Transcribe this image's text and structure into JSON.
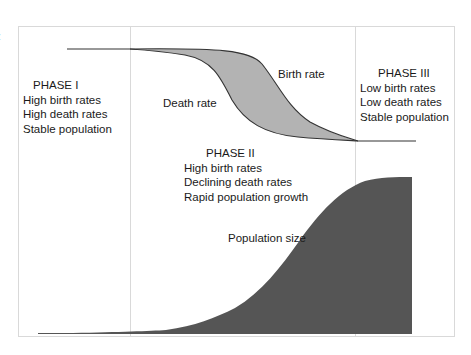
{
  "figure": {
    "edge_fragment": ":"
  },
  "phases": [
    {
      "title": "PHASE I",
      "lines": [
        "High birth rates",
        "High death rates",
        "Stable population"
      ]
    },
    {
      "title": "PHASE II",
      "lines": [
        "High birth rates",
        "Declining death rates",
        "Rapid population growth"
      ]
    },
    {
      "title": "PHASE III",
      "lines": [
        "Low birth rates",
        "Low death rates",
        "Stable population"
      ]
    }
  ],
  "curve_labels": {
    "birth_rate": "Birth rate",
    "death_rate": "Death rate",
    "population_size": "Population size"
  },
  "colors": {
    "rate_gap_fill": "#b3b3b3",
    "population_fill": "#555555",
    "frame": "#d9d9d9",
    "curve_stroke": "#333333"
  }
}
